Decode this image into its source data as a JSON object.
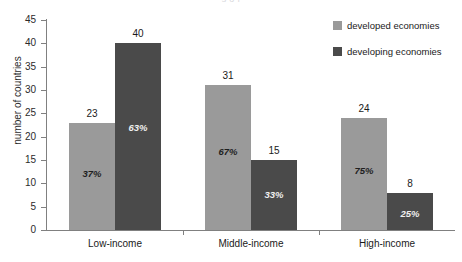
{
  "chart_data": {
    "type": "bar",
    "title": "",
    "xlabel": "",
    "ylabel": "number of countries",
    "ylim": [
      0,
      45
    ],
    "yticks": [
      0,
      5,
      10,
      15,
      20,
      25,
      30,
      35,
      40,
      45
    ],
    "grid": false,
    "legend_position": "top-right",
    "categories": [
      "Low-income",
      "Middle-income",
      "High-income"
    ],
    "series": [
      {
        "name": "developed economies",
        "color": "#9a9a9a",
        "values": [
          23,
          31,
          24
        ],
        "percent_labels": [
          "37%",
          "67%",
          "75%"
        ]
      },
      {
        "name": "developing economies",
        "color": "#4a4a4a",
        "values": [
          40,
          15,
          8
        ],
        "percent_labels": [
          "63%",
          "33%",
          "25%"
        ]
      }
    ]
  },
  "top_strip": {
    "text": "s  o  f"
  },
  "axis": {
    "y_title": "number of countries",
    "tick_labels": [
      "45",
      "40",
      "35",
      "30",
      "25",
      "20",
      "15",
      "10",
      "5",
      "0"
    ],
    "category_labels": [
      "Low-income",
      "Middle-income",
      "High-income"
    ]
  },
  "legend": {
    "items": [
      {
        "label": "developed economies",
        "color": "#9a9a9a"
      },
      {
        "label": "developing economies",
        "color": "#4a4a4a"
      }
    ]
  },
  "bars": [
    {
      "group": "Low-income",
      "series": "developed economies",
      "value": "23",
      "percent": "37%"
    },
    {
      "group": "Low-income",
      "series": "developing economies",
      "value": "40",
      "percent": "63%"
    },
    {
      "group": "Middle-income",
      "series": "developed economies",
      "value": "31",
      "percent": "67%"
    },
    {
      "group": "Middle-income",
      "series": "developing economies",
      "value": "15",
      "percent": "33%"
    },
    {
      "group": "High-income",
      "series": "developed economies",
      "value": "24",
      "percent": "75%"
    },
    {
      "group": "High-income",
      "series": "developing economies",
      "value": "8",
      "percent": "25%"
    }
  ]
}
